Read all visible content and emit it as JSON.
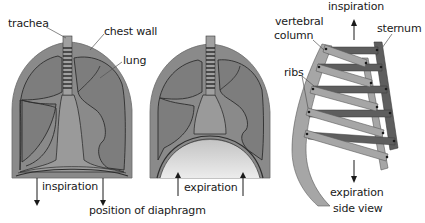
{
  "diagram": {
    "colors": {
      "chest_wall": "#8a8a8a",
      "lung_fill": "#7d7d7d",
      "outline": "#2e2e2e",
      "mediastinum": "#9a9a9a",
      "dome_light": "#d8d8d8",
      "rib_light": "#a6a6a6",
      "rib_dark": "#5e5e5e",
      "text": "#1a1a1a"
    },
    "panel_inspiration": {
      "labels": {
        "trachea": "trachea",
        "chest_wall": "chest wall",
        "lung": "lung",
        "movement": "inspiration",
        "caption": "position of diaphragm"
      },
      "arrow_direction": "down"
    },
    "panel_expiration": {
      "labels": {
        "movement": "expiration"
      },
      "arrow_direction": "up"
    },
    "panel_side_view": {
      "labels": {
        "top_movement": "inspiration",
        "vertebral_column_line1": "vertebral",
        "vertebral_column_line2": "column",
        "sternum": "sternum",
        "ribs": "ribs",
        "bottom_movement": "expiration",
        "caption": "side view"
      },
      "rib_count": 5
    }
  }
}
